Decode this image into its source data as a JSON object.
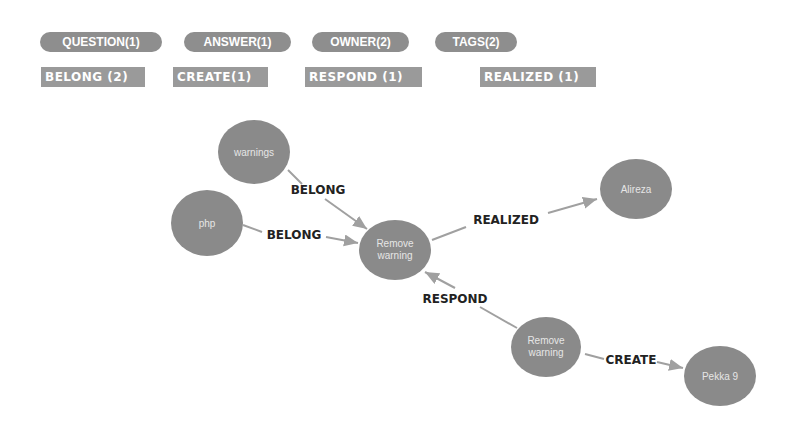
{
  "legend": {
    "node_types": [
      {
        "label": "QUESTION(1)",
        "color": "#8e8e8e"
      },
      {
        "label": "ANSWER(1)",
        "color": "#8e8e8e"
      },
      {
        "label": "OWNER(2)",
        "color": "#8e8e8e"
      },
      {
        "label": "TAGS(2)",
        "color": "#8e8e8e"
      }
    ],
    "relationship_types": [
      {
        "label": "BELONG (2)"
      },
      {
        "label": "CREATE(1)"
      },
      {
        "label": "RESPOND (1)"
      },
      {
        "label": "REALIZED (1)"
      }
    ]
  },
  "graph": {
    "nodes": [
      {
        "id": "warnings",
        "label": "warnings",
        "type": "TAGS"
      },
      {
        "id": "php",
        "label": "php",
        "type": "TAGS"
      },
      {
        "id": "question",
        "label_line1": "Remove",
        "label_line2": "warning",
        "type": "QUESTION"
      },
      {
        "id": "alireza",
        "label": "Alireza",
        "type": "OWNER"
      },
      {
        "id": "answer",
        "label_line1": "Remove",
        "label_line2": "warning",
        "type": "ANSWER"
      },
      {
        "id": "pekka",
        "label": "Pekka 9",
        "type": "OWNER"
      }
    ],
    "edges": [
      {
        "from": "warnings",
        "to": "question",
        "label": "BELONG"
      },
      {
        "from": "php",
        "to": "question",
        "label": "BELONG"
      },
      {
        "from": "question",
        "to": "alireza",
        "label": "REALIZED"
      },
      {
        "from": "answer",
        "to": "question",
        "label": "RESPOND"
      },
      {
        "from": "answer",
        "to": "pekka",
        "label": "CREATE"
      }
    ]
  },
  "colors": {
    "node_fill": "#8a8a8a",
    "edge_stroke": "#a0a0a0",
    "pill_bg": "#8e8e8e"
  }
}
